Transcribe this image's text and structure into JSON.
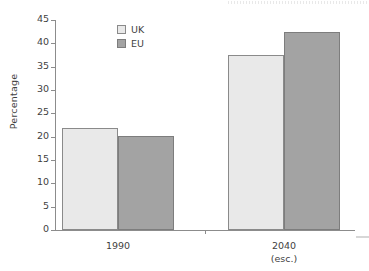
{
  "chart_data": {
    "type": "bar",
    "title": "",
    "subtitle": "",
    "xlabel": "",
    "ylabel": "Percentage",
    "ylim": [
      0,
      45
    ],
    "ytick_step": 5,
    "yticks": [
      45,
      40,
      35,
      30,
      25,
      20,
      15,
      10,
      5,
      0
    ],
    "grid": false,
    "legend_position": "top-left-inside",
    "categories": [
      "1990",
      "2040"
    ],
    "category_sublabels": [
      "",
      "(esc.)"
    ],
    "series": [
      {
        "name": "UK",
        "color": "#e9e9e9",
        "values": [
          21.8,
          37.5
        ]
      },
      {
        "name": "EU",
        "color": "#a3a3a3",
        "values": [
          20.2,
          42.4
        ]
      }
    ]
  },
  "legend": {
    "items": [
      {
        "label": "UK",
        "swatch": "legend-swatch-uk"
      },
      {
        "label": "EU",
        "swatch": "legend-swatch-eu"
      }
    ]
  },
  "axes": {
    "y_label": "Percentage",
    "y_tick_labels": [
      "45",
      "40",
      "35",
      "30",
      "25",
      "20",
      "15",
      "10",
      "5",
      "0"
    ],
    "x_tick_labels": [
      "1990",
      "2040"
    ],
    "x_tick_sublabels": [
      "",
      "(esc.)"
    ]
  },
  "colors": {
    "uk_fill": "#e9e9e9",
    "eu_fill": "#a3a3a3",
    "bar_stroke": "#8a8a8a",
    "axis": "#8c8c8c",
    "text": "#3f3f3f",
    "background": "#ffffff"
  }
}
